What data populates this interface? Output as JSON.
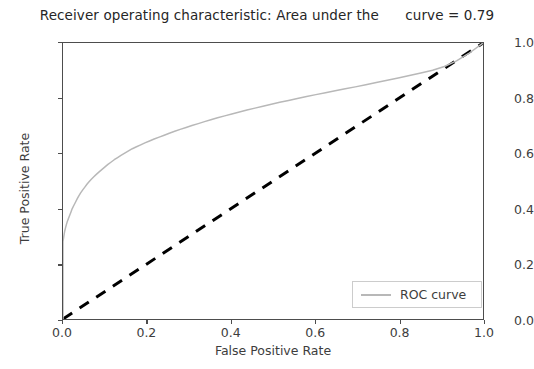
{
  "chart_data": {
    "type": "line",
    "title": "Receiver operating characteristic: Area under the      curve = 0.79",
    "title_parts": {
      "prefix": "Receiver operating characteristic: Area under the",
      "auc_text": "curve = 0.79",
      "auc_value": 0.79
    },
    "xlabel": "False Positive Rate",
    "ylabel": "True Positive Rate",
    "xlim": [
      0.0,
      1.0
    ],
    "ylim": [
      0.0,
      1.0
    ],
    "grid": false,
    "legend_position": "lower right",
    "xticks": [
      "0.0",
      "0.2",
      "0.4",
      "0.6",
      "0.8",
      "1.0"
    ],
    "xtick_values": [
      0.0,
      0.2,
      0.4,
      0.6,
      0.8,
      1.0
    ],
    "yticks": [
      "0.0",
      "0.2",
      "0.4",
      "0.6",
      "0.8",
      "1.0"
    ],
    "ytick_values": [
      0.0,
      0.2,
      0.4,
      0.6,
      0.8,
      1.0
    ],
    "series": [
      {
        "name": "ROC curve",
        "color": "#b8b8b8",
        "style": "solid",
        "width": 1.5,
        "in_legend": true,
        "x": [
          0.0,
          0.0,
          0.002,
          0.004,
          0.006,
          0.008,
          0.01,
          0.013,
          0.016,
          0.019,
          0.022,
          0.026,
          0.03,
          0.034,
          0.038,
          0.042,
          0.047,
          0.052,
          0.057,
          0.062,
          0.068,
          0.074,
          0.08,
          0.086,
          0.093,
          0.1,
          0.107,
          0.114,
          0.122,
          0.13,
          0.138,
          0.147,
          0.156,
          0.165,
          0.175,
          0.185,
          0.195,
          0.206,
          0.217,
          0.229,
          0.241,
          0.253,
          0.266,
          0.279,
          0.293,
          0.307,
          0.322,
          0.337,
          0.352,
          0.368,
          0.385,
          0.402,
          0.42,
          0.438,
          0.457,
          0.476,
          0.496,
          0.516,
          0.537,
          0.558,
          0.58,
          0.602,
          0.625,
          0.648,
          0.672,
          0.696,
          0.721,
          0.746,
          0.772,
          0.798,
          0.825,
          0.852,
          0.88,
          0.908,
          0.937,
          0.966,
          1.0
        ],
        "y": [
          0.0,
          0.28,
          0.3,
          0.318,
          0.33,
          0.342,
          0.352,
          0.364,
          0.376,
          0.388,
          0.4,
          0.412,
          0.424,
          0.436,
          0.447,
          0.457,
          0.468,
          0.478,
          0.488,
          0.497,
          0.507,
          0.516,
          0.525,
          0.533,
          0.542,
          0.551,
          0.56,
          0.568,
          0.577,
          0.585,
          0.593,
          0.601,
          0.609,
          0.617,
          0.624,
          0.631,
          0.638,
          0.645,
          0.652,
          0.659,
          0.666,
          0.673,
          0.68,
          0.687,
          0.694,
          0.701,
          0.708,
          0.715,
          0.722,
          0.729,
          0.736,
          0.743,
          0.75,
          0.757,
          0.764,
          0.771,
          0.778,
          0.785,
          0.792,
          0.799,
          0.806,
          0.813,
          0.82,
          0.827,
          0.834,
          0.841,
          0.849,
          0.857,
          0.865,
          0.873,
          0.882,
          0.891,
          0.901,
          0.915,
          0.935,
          0.962,
          1.0
        ]
      },
      {
        "name": "chance-diagonal",
        "color": "#000000",
        "style": "dashed",
        "width": 3.0,
        "in_legend": false,
        "x": [
          0.0,
          1.0
        ],
        "y": [
          0.0,
          1.0
        ]
      }
    ]
  },
  "legend": {
    "entries": [
      {
        "label": "ROC curve",
        "color": "#b8b8b8"
      }
    ]
  },
  "colors": {
    "roc_curve": "#b8b8b8",
    "diagonal": "#000000",
    "axis": "#4d4d4d",
    "text": "#3d3d3d",
    "background": "#ffffff"
  }
}
